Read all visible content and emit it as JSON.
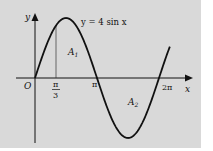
{
  "diagram": {
    "type": "function-graph",
    "function_label": "y = 4 sin x",
    "axes": {
      "x_label": "x",
      "y_label": "y",
      "origin_label": "O",
      "x_ticks": [
        {
          "label_num": "π",
          "label_den": "3",
          "value": "pi/3"
        },
        {
          "label": "π",
          "value": "pi"
        },
        {
          "label": "2π",
          "value": "2pi"
        }
      ]
    },
    "regions": [
      {
        "label": "A",
        "subscript": "1",
        "description": "area between curve and x-axis from π/3 to π"
      },
      {
        "label": "A",
        "subscript": "2",
        "description": "area between curve and x-axis from π to 2π"
      }
    ],
    "colors": {
      "background": "#d9d9d9",
      "curve": "#111111",
      "axes": "#111111"
    }
  }
}
